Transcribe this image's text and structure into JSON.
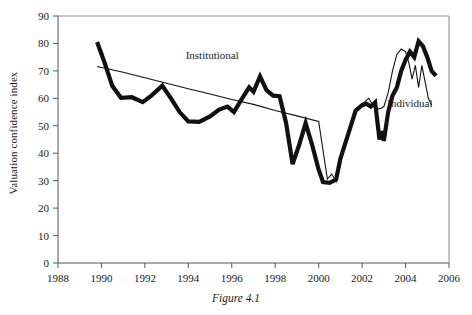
{
  "caption": "Figure 4.1",
  "chart_data": {
    "type": "line",
    "title": "",
    "xlabel": "",
    "ylabel": "Valuation confidence index",
    "xlim": [
      1988,
      2006
    ],
    "ylim": [
      0,
      90
    ],
    "xticks": [
      1988,
      1990,
      1992,
      1994,
      1996,
      1998,
      2000,
      2002,
      2004,
      2006
    ],
    "yticks": [
      0,
      10,
      20,
      30,
      40,
      50,
      60,
      70,
      80,
      90
    ],
    "grid": false,
    "legend_position": "inline-annotations",
    "annotations": [
      {
        "text": "Institutional",
        "x": 1995.1,
        "y": 74.5
      },
      {
        "text": "Individual",
        "x": 2004.2,
        "y": 57.0
      }
    ],
    "series": [
      {
        "name": "Institutional",
        "style": "thick",
        "color": "#111111",
        "width": 4.2,
        "points": [
          [
            1989.8,
            80.5
          ],
          [
            1990.1,
            74.0
          ],
          [
            1990.5,
            64.5
          ],
          [
            1990.9,
            60.2
          ],
          [
            1991.4,
            60.4
          ],
          [
            1991.9,
            58.6
          ],
          [
            1992.3,
            61.0
          ],
          [
            1992.8,
            64.6
          ],
          [
            1993.2,
            60.0
          ],
          [
            1993.6,
            55.0
          ],
          [
            1994.0,
            51.6
          ],
          [
            1994.5,
            51.4
          ],
          [
            1995.0,
            53.4
          ],
          [
            1995.4,
            55.8
          ],
          [
            1995.8,
            57.0
          ],
          [
            1996.1,
            55.0
          ],
          [
            1996.4,
            59.0
          ],
          [
            1996.8,
            64.0
          ],
          [
            1997.0,
            62.4
          ],
          [
            1997.3,
            68.0
          ],
          [
            1997.6,
            63.0
          ],
          [
            1997.9,
            61.0
          ],
          [
            1998.2,
            60.8
          ],
          [
            1998.5,
            51.0
          ],
          [
            1998.8,
            36.0
          ],
          [
            1999.1,
            43.0
          ],
          [
            1999.4,
            51.0
          ],
          [
            1999.7,
            43.0
          ],
          [
            2000.0,
            34.0
          ],
          [
            2000.2,
            29.5
          ],
          [
            2000.5,
            29.2
          ],
          [
            2000.8,
            30.4
          ],
          [
            2001.0,
            38.0
          ],
          [
            2001.4,
            48.0
          ],
          [
            2001.7,
            55.5
          ],
          [
            2002.0,
            57.5
          ],
          [
            2002.2,
            58.0
          ],
          [
            2002.4,
            57.0
          ],
          [
            2002.6,
            58.5
          ],
          [
            2002.8,
            45.0
          ],
          [
            2002.9,
            48.0
          ],
          [
            2003.0,
            44.5
          ],
          [
            2003.2,
            55.0
          ],
          [
            2003.4,
            61.0
          ],
          [
            2003.6,
            64.0
          ],
          [
            2003.8,
            70.0
          ],
          [
            2004.0,
            74.0
          ],
          [
            2004.2,
            77.0
          ],
          [
            2004.4,
            75.0
          ],
          [
            2004.6,
            80.8
          ],
          [
            2004.8,
            79.0
          ],
          [
            2005.0,
            75.0
          ],
          [
            2005.2,
            70.0
          ],
          [
            2005.4,
            68.2
          ]
        ]
      },
      {
        "name": "Individual",
        "style": "thin",
        "color": "#111111",
        "width": 1.1,
        "points": [
          [
            1989.8,
            71.6
          ],
          [
            1991.0,
            69.5
          ],
          [
            1992.0,
            67.5
          ],
          [
            1993.0,
            65.5
          ],
          [
            1994.0,
            63.5
          ],
          [
            1995.0,
            61.6
          ],
          [
            1996.0,
            59.6
          ],
          [
            1997.0,
            57.8
          ],
          [
            1998.0,
            55.6
          ],
          [
            1999.0,
            53.6
          ],
          [
            2000.0,
            51.6
          ],
          [
            2000.4,
            30.6
          ],
          [
            2000.6,
            32.4
          ],
          [
            2000.8,
            29.6
          ],
          [
            2001.0,
            37.0
          ],
          [
            2001.4,
            48.0
          ],
          [
            2001.8,
            56.0
          ],
          [
            2002.0,
            57.8
          ],
          [
            2002.3,
            60.0
          ],
          [
            2002.5,
            57.5
          ],
          [
            2002.7,
            56.0
          ],
          [
            2002.9,
            56.5
          ],
          [
            2003.0,
            57.0
          ],
          [
            2003.2,
            62.0
          ],
          [
            2003.4,
            70.0
          ],
          [
            2003.6,
            76.0
          ],
          [
            2003.8,
            78.0
          ],
          [
            2004.0,
            77.0
          ],
          [
            2004.15,
            73.0
          ],
          [
            2004.3,
            67.0
          ],
          [
            2004.45,
            72.0
          ],
          [
            2004.6,
            64.0
          ],
          [
            2004.75,
            72.0
          ],
          [
            2004.9,
            66.0
          ],
          [
            2005.05,
            60.0
          ],
          [
            2005.2,
            57.5
          ]
        ]
      }
    ]
  }
}
